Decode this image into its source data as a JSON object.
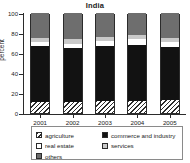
{
  "chart_data": {
    "type": "bar",
    "subtype": "stacked-percentage",
    "title": "India",
    "xlabel": "",
    "ylabel": "percent",
    "ylim": [
      0,
      100
    ],
    "yticks": [
      0,
      20,
      40,
      60,
      80,
      100
    ],
    "grid": false,
    "legend_position": "bottom",
    "categories": [
      "2001",
      "2002",
      "2003",
      "2004",
      "2005"
    ],
    "series": [
      {
        "name": "agriculture",
        "key": "agriculture",
        "values": [
          11,
          11,
          12,
          12,
          13
        ]
      },
      {
        "name": "commerce and industry",
        "key": "commerce",
        "values": [
          56,
          54,
          55,
          56,
          53
        ]
      },
      {
        "name": "real estate",
        "key": "realestate",
        "values": [
          4,
          4,
          5,
          6,
          5
        ]
      },
      {
        "name": "services",
        "key": "services",
        "values": [
          4,
          5,
          4,
          4,
          4
        ]
      },
      {
        "name": "others",
        "key": "others",
        "values": [
          25,
          26,
          24,
          22,
          25
        ]
      }
    ]
  },
  "axes": {
    "y_title": "percent",
    "y_tick_labels": [
      "0",
      "20",
      "40",
      "60",
      "80",
      "100"
    ],
    "x_tick_labels": [
      "2001",
      "2002",
      "2003",
      "2004",
      "2005"
    ]
  },
  "legend": {
    "left_column": [
      {
        "label": "agriculture",
        "key": "agriculture"
      },
      {
        "label": "real estate",
        "key": "realestate"
      },
      {
        "label": "others",
        "key": "others"
      }
    ],
    "right_column": [
      {
        "label": "commerce and industry",
        "key": "commerce"
      },
      {
        "label": "services",
        "key": "services"
      }
    ]
  },
  "colors": {
    "agriculture": "#ffffff",
    "commerce": "#121212",
    "realestate": "#ffffff",
    "services": "#c9c9c9",
    "others": "#6e6e6e",
    "axis": "#2b2b2b",
    "legend_border": "#8a8a8a",
    "background": "#ffffff"
  }
}
